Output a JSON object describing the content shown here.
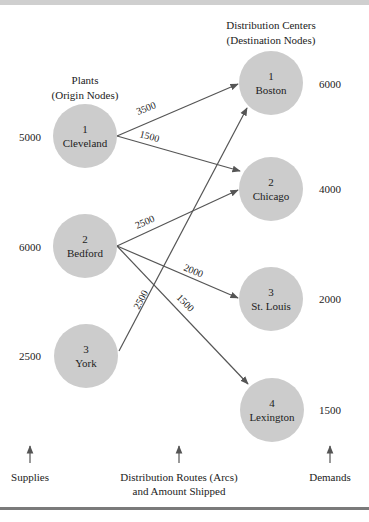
{
  "headers": {
    "origins_title": "Plants",
    "origins_subtitle": "(Origin Nodes)",
    "destinations_title": "Distribution Centers",
    "destinations_subtitle": "(Destination Nodes)"
  },
  "origins": [
    {
      "id": "1",
      "name": "Cleveland",
      "supply": "5000",
      "cx": 85,
      "cy": 136
    },
    {
      "id": "2",
      "name": "Bedford",
      "supply": "6000",
      "cx": 85,
      "cy": 246
    },
    {
      "id": "3",
      "name": "York",
      "supply": "2500",
      "cx": 86,
      "cy": 356
    }
  ],
  "destinations": [
    {
      "id": "1",
      "name": "Boston",
      "demand": "6000",
      "cx": 271,
      "cy": 83
    },
    {
      "id": "2",
      "name": "Chicago",
      "demand": "4000",
      "cx": 271,
      "cy": 189
    },
    {
      "id": "3",
      "name": "St. Louis",
      "demand": "2000",
      "cx": 271,
      "cy": 299
    },
    {
      "id": "4",
      "name": "Lexington",
      "demand": "1500",
      "cx": 272,
      "cy": 410
    }
  ],
  "arcs": [
    {
      "from": "Cleveland",
      "to": "Boston",
      "amount": "3500"
    },
    {
      "from": "Cleveland",
      "to": "Chicago",
      "amount": "1500"
    },
    {
      "from": "Bedford",
      "to": "Chicago",
      "amount": "2500"
    },
    {
      "from": "Bedford",
      "to": "St. Louis",
      "amount": "2000"
    },
    {
      "from": "Bedford",
      "to": "Lexington",
      "amount": "1500"
    },
    {
      "from": "York",
      "to": "Boston",
      "amount": "2500"
    }
  ],
  "footer": {
    "supplies_label": "Supplies",
    "routes_label_line1": "Distribution Routes (Arcs)",
    "routes_label_line2": "and Amount Shipped",
    "demands_label": "Demands"
  },
  "colors": {
    "node_fill": "#cccccc",
    "arc_stroke": "#555555",
    "rule": "#7a7a7a"
  }
}
